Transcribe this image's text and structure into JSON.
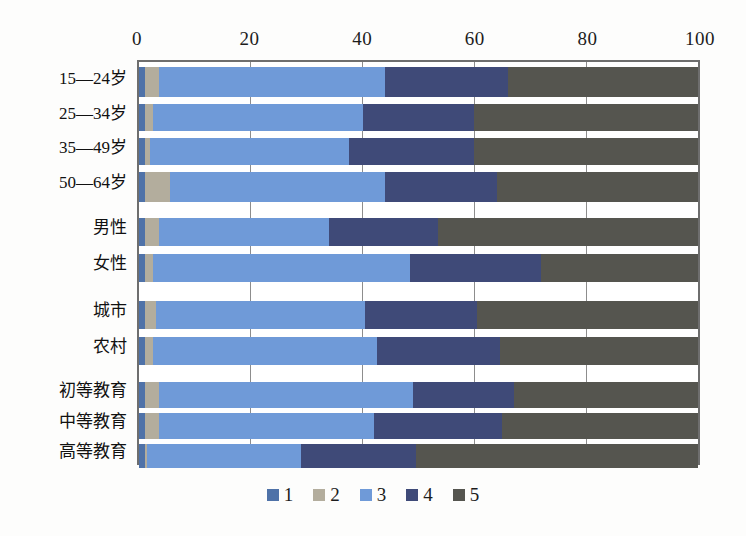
{
  "chart_data": {
    "type": "bar",
    "orientation": "horizontal",
    "stacked": true,
    "stack_total": 100,
    "title": "",
    "subtitle": "",
    "xlabel": "",
    "ylabel": "",
    "xlim": [
      0,
      100
    ],
    "xticks": [
      0,
      20,
      40,
      60,
      80,
      100
    ],
    "xtick_labels": [
      "0",
      "20",
      "40",
      "60",
      "80",
      "100"
    ],
    "grid": true,
    "grid_axis": "x",
    "legend_position": "bottom",
    "legend": [
      "1",
      "2",
      "3",
      "4",
      "5"
    ],
    "series": [
      {
        "name": "1",
        "color": "#4f72a8",
        "values": [
          1.0,
          1.0,
          1.0,
          1.0,
          1.0,
          1.0,
          1.0,
          1.0,
          1.0,
          1.0,
          1.0
        ]
      },
      {
        "name": "2",
        "color": "#b3ad9d",
        "values": [
          2.5,
          1.5,
          1.0,
          4.5,
          2.5,
          1.5,
          2.0,
          1.5,
          2.5,
          2.5,
          0.5
        ]
      },
      {
        "name": "3",
        "color": "#6f9ad8",
        "values": [
          40.5,
          37.5,
          35.5,
          38.5,
          30.5,
          46.0,
          37.5,
          40.0,
          45.5,
          38.5,
          27.5
        ]
      },
      {
        "name": "4",
        "color": "#3f4a78",
        "values": [
          22.0,
          20.0,
          22.5,
          20.0,
          19.5,
          23.5,
          20.0,
          22.0,
          18.0,
          23.0,
          20.5
        ]
      },
      {
        "name": "5",
        "color": "#55554f",
        "values": [
          34.0,
          40.0,
          40.0,
          36.0,
          46.5,
          28.0,
          39.5,
          35.5,
          33.0,
          35.0,
          50.5
        ]
      }
    ],
    "categories": [
      "15—24岁",
      "25—34岁",
      "35—49岁",
      "50—64岁",
      "男性",
      "女性",
      "城市",
      "农村",
      "初等教育",
      "中等教育",
      "高等教育"
    ],
    "category_groups": [
      {
        "name": "age",
        "indices": [
          0,
          1,
          2,
          3
        ]
      },
      {
        "name": "gender",
        "indices": [
          4,
          5
        ]
      },
      {
        "name": "residence",
        "indices": [
          6,
          7
        ]
      },
      {
        "name": "education",
        "indices": [
          8,
          9,
          10
        ]
      }
    ]
  },
  "colors": {
    "series_1": "#4f72a8",
    "series_2": "#b3ad9d",
    "series_3": "#6f9ad8",
    "series_4": "#3f4a78",
    "series_5": "#55554f",
    "axis": "#6e6e6e",
    "gridline": "#8d8d8d",
    "background": "#fdfdfc",
    "text": "#1c1c1c"
  },
  "layout": {
    "row_positions": [
      {
        "top": 5,
        "height": 30
      },
      {
        "top": 42,
        "height": 27
      },
      {
        "top": 76,
        "height": 27
      },
      {
        "top": 110,
        "height": 30
      },
      {
        "top": 156,
        "height": 28
      },
      {
        "top": 192,
        "height": 28
      },
      {
        "top": 239,
        "height": 28
      },
      {
        "top": 275,
        "height": 28
      },
      {
        "top": 320,
        "height": 26
      },
      {
        "top": 351,
        "height": 26
      },
      {
        "top": 382,
        "height": 24
      }
    ],
    "label_positions": [
      {
        "top": 10
      },
      {
        "top": 45
      },
      {
        "top": 79
      },
      {
        "top": 114
      },
      {
        "top": 159
      },
      {
        "top": 195
      },
      {
        "top": 242
      },
      {
        "top": 278
      },
      {
        "top": 322
      },
      {
        "top": 353
      },
      {
        "top": 383
      }
    ]
  }
}
